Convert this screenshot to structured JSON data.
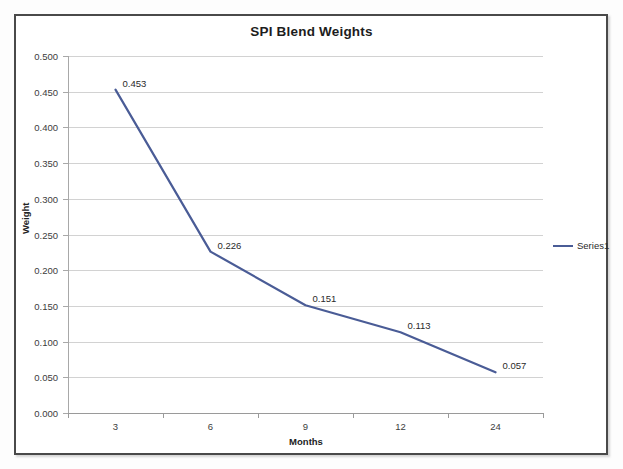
{
  "frame": {
    "border_color": "#4a4a4a",
    "background": "#ffffff"
  },
  "chart_data": {
    "type": "line",
    "title": "SPI Blend Weights",
    "xlabel": "Months",
    "ylabel": "Weight",
    "categories": [
      "3",
      "6",
      "9",
      "12",
      "24"
    ],
    "values": [
      0.453,
      0.226,
      0.151,
      0.113,
      0.057
    ],
    "data_labels": [
      "0.453",
      "0.226",
      "0.151",
      "0.113",
      "0.057"
    ],
    "series": [
      {
        "name": "Series1",
        "color": "#4a5c96",
        "values": [
          0.453,
          0.226,
          0.151,
          0.113,
          0.057
        ]
      }
    ],
    "ylim": [
      0.0,
      0.5
    ],
    "ytick_step": 0.05,
    "ytick_labels": [
      "0.500",
      "0.450",
      "0.400",
      "0.350",
      "0.300",
      "0.250",
      "0.200",
      "0.150",
      "0.100",
      "0.050",
      "0.000"
    ],
    "ytick_values": [
      0.5,
      0.45,
      0.4,
      0.35,
      0.3,
      0.25,
      0.2,
      0.15,
      0.1,
      0.05,
      0.0
    ],
    "xtick_labels": [
      "3",
      "6",
      "9",
      "12",
      "24"
    ],
    "grid": "horizontal",
    "legend_position": "right",
    "legend_entries": [
      "Series1"
    ],
    "line_color": "#4a5c96",
    "line_width": 2.2,
    "markers": "none"
  }
}
